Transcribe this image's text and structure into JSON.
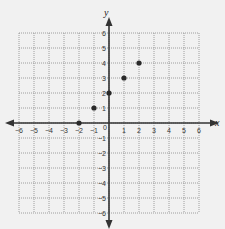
{
  "chart_data": {
    "type": "scatter",
    "title": "",
    "xlabel": "x",
    "ylabel": "y",
    "xlim": [
      -6,
      6
    ],
    "ylim": [
      -6,
      6
    ],
    "grid": true,
    "grid_style": "dotted",
    "x_ticks": [
      -6,
      -5,
      -4,
      -3,
      -2,
      -1,
      1,
      2,
      3,
      4,
      5,
      6
    ],
    "y_ticks": [
      -6,
      -5,
      -4,
      -3,
      -2,
      -1,
      1,
      2,
      3,
      4,
      5,
      6
    ],
    "origin_label": "0",
    "points": [
      {
        "x": -2,
        "y": 0
      },
      {
        "x": -1,
        "y": 1
      },
      {
        "x": 0,
        "y": 2
      },
      {
        "x": 1,
        "y": 3
      },
      {
        "x": 2,
        "y": 4
      }
    ],
    "colors": {
      "background": "#f1f1f1",
      "grid": "#8a8a8a",
      "axis": "#333333",
      "point": "#2a2a2a"
    }
  }
}
